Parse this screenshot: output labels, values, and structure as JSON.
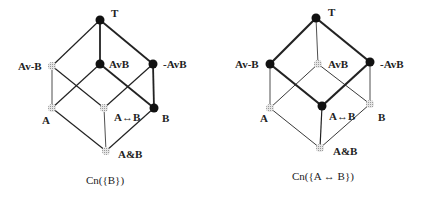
{
  "diagrams": [
    {
      "caption": "Cn({B})",
      "nodes": {
        "T": {
          "label": "T",
          "filled": true
        },
        "AvnB": {
          "label": "Av-B",
          "filled": false
        },
        "AvB": {
          "label": "AvB",
          "filled": true
        },
        "nAvB": {
          "label": "-AvB",
          "filled": true
        },
        "A": {
          "label": "A",
          "filled": false
        },
        "AeqB": {
          "label": "A↔B",
          "filled": false
        },
        "B": {
          "label": "B",
          "filled": true
        },
        "AandB": {
          "label": "A&B",
          "filled": false
        }
      }
    },
    {
      "caption": "Cn({A ↔ B})",
      "nodes": {
        "T": {
          "label": "T",
          "filled": true
        },
        "AvnB": {
          "label": "Av-B",
          "filled": true
        },
        "AvB": {
          "label": "AvB",
          "filled": false
        },
        "nAvB": {
          "label": "-AvB",
          "filled": true
        },
        "A": {
          "label": "A",
          "filled": false
        },
        "AeqB": {
          "label": "A↔B",
          "filled": true
        },
        "B": {
          "label": "B",
          "filled": false
        },
        "AandB": {
          "label": "A&B",
          "filled": false
        }
      }
    }
  ],
  "colors": {
    "filled": "#111111",
    "hollow": "#b8b8b8",
    "edge": "#222222"
  }
}
